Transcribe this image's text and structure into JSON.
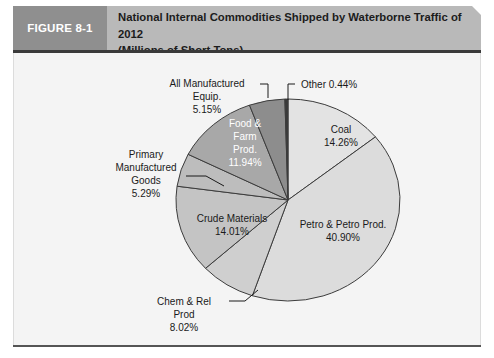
{
  "figure": {
    "tag": "FIGURE 8-1",
    "title_line1": "National Internal Commodities Shipped by Waterborne Traffic of 2012",
    "title_line2": "(Millions of Short Tons)"
  },
  "colors": {
    "header_band": "#b9b9b9",
    "header_tag": "#8f8f8f",
    "header_rule": "#3a3a3a",
    "panel_background": "#f4f4f4",
    "slice_outline": "#3c3c3c"
  },
  "chart_data": {
    "type": "pie",
    "title": "National Internal Commodities Shipped by Waterborne Traffic of 2012 (Millions of Short Tons)",
    "xlabel": "",
    "ylabel": "",
    "units": "percent",
    "legend": "none",
    "grid": false,
    "start_angle_deg": 0,
    "direction": "clockwise",
    "categories": [
      "Coal",
      "Petro & Petro Prod.",
      "Chem & Rel Prod",
      "Crude Materials",
      "Primary Manufactured Goods",
      "Food & Farm Prod.",
      "All Manufactured Equip.",
      "Other"
    ],
    "values": [
      14.26,
      40.9,
      8.02,
      14.01,
      5.29,
      11.94,
      5.15,
      0.44
    ],
    "slices": [
      {
        "name": "Coal",
        "value": 14.26,
        "label_text": "Coal",
        "value_text": "14.26%",
        "color": "#e3e3e3",
        "label_placement": "inside",
        "label_color": "dark"
      },
      {
        "name": "Petro & Petro Prod.",
        "value": 40.9,
        "label_text": "Petro & Petro Prod.",
        "value_text": "40.90%",
        "color": "#dcdcdc",
        "label_placement": "inside",
        "label_color": "dark"
      },
      {
        "name": "Chem & Rel Prod",
        "value": 8.02,
        "label_text": "Chem & Rel Prod",
        "value_text": "8.02%",
        "color": "#cfcfcf",
        "label_placement": "callout",
        "label_color": "dark"
      },
      {
        "name": "Crude Materials",
        "value": 14.01,
        "label_text": "Crude Materials",
        "value_text": "14.01%",
        "color": "#c4c4c4",
        "label_placement": "inside",
        "label_color": "dark"
      },
      {
        "name": "Primary Manufactured Goods",
        "value": 5.29,
        "label_text": "Primary Manufactured Goods",
        "value_text": "5.29%",
        "color": "#bdbdbd",
        "label_placement": "callout",
        "label_color": "dark"
      },
      {
        "name": "Food & Farm Prod.",
        "value": 11.94,
        "label_text": "Food & Farm Prod.",
        "value_text": "11.94%",
        "color": "#a8a8a8",
        "label_placement": "inside",
        "label_color": "light"
      },
      {
        "name": "All Manufactured Equip.",
        "value": 5.15,
        "label_text": "All Manufactured Equip.",
        "value_text": "5.15%",
        "color": "#8d8d8d",
        "label_placement": "callout",
        "label_color": "dark"
      },
      {
        "name": "Other",
        "value": 0.44,
        "label_text": "Other",
        "value_text": "0.44%",
        "color": "#3a3a3a",
        "label_placement": "callout",
        "label_color": "dark"
      }
    ]
  },
  "labels": {
    "coal_name": "Coal",
    "coal_value": "14.26%",
    "petro_name": "Petro & Petro Prod.",
    "petro_value": "40.90%",
    "chem_name": "Chem & Rel",
    "chem_name2": "Prod",
    "chem_value": "8.02%",
    "crude_name": "Crude Materials",
    "crude_value": "14.01%",
    "primary_name1": "Primary",
    "primary_name2": "Manufactured",
    "primary_name3": "Goods",
    "primary_value": "5.29%",
    "food_name1": "Food &",
    "food_name2": "Farm",
    "food_name3": "Prod.",
    "food_value": "11.94%",
    "allmfg_name1": "All Manufactured",
    "allmfg_name2": "Equip.",
    "allmfg_value": "5.15%",
    "other_combined": "Other 0.44%"
  }
}
